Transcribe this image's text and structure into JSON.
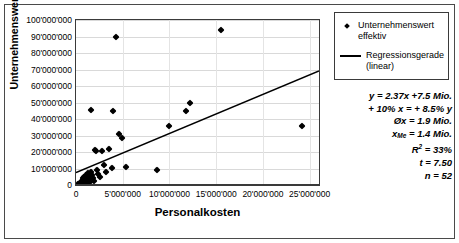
{
  "chart_data": {
    "type": "scatter",
    "title": "",
    "xlabel": "Personalkosten",
    "ylabel": "Unternehmenswert",
    "xlim": [
      0,
      26000000
    ],
    "ylim": [
      0,
      100000000
    ],
    "grid": true,
    "legend_position": "right",
    "x_ticks": [
      {
        "value": 0,
        "label": "0"
      },
      {
        "value": 5000000,
        "label": "5'000'000"
      },
      {
        "value": 10000000,
        "label": "10'000'000"
      },
      {
        "value": 15000000,
        "label": "15'000'000"
      },
      {
        "value": 20000000,
        "label": "20'000'000"
      },
      {
        "value": 25000000,
        "label": "25'000'000"
      }
    ],
    "y_ticks": [
      {
        "value": 0,
        "label": "0"
      },
      {
        "value": 10000000,
        "label": "10'000'000"
      },
      {
        "value": 20000000,
        "label": "20'000'000"
      },
      {
        "value": 30000000,
        "label": "30'000'000"
      },
      {
        "value": 40000000,
        "label": "40'000'000"
      },
      {
        "value": 50000000,
        "label": "50'000'000"
      },
      {
        "value": 60000000,
        "label": "60'000'000"
      },
      {
        "value": 70000000,
        "label": "70'000'000"
      },
      {
        "value": 80000000,
        "label": "80'000'000"
      },
      {
        "value": 90000000,
        "label": "90'000'000"
      },
      {
        "value": 100000000,
        "label": "100'000'000"
      }
    ],
    "series": [
      {
        "name": "Unternehmenswert effektiv",
        "type": "scatter",
        "marker": "diamond",
        "color": "#000000",
        "points": [
          [
            200000,
            500000
          ],
          [
            300000,
            900000
          ],
          [
            350000,
            300000
          ],
          [
            400000,
            1400000
          ],
          [
            450000,
            600000
          ],
          [
            500000,
            2000000
          ],
          [
            520000,
            1000000
          ],
          [
            560000,
            400000
          ],
          [
            600000,
            2600000
          ],
          [
            620000,
            1600000
          ],
          [
            650000,
            800000
          ],
          [
            700000,
            3200000
          ],
          [
            720000,
            2200000
          ],
          [
            760000,
            1200000
          ],
          [
            800000,
            4000000
          ],
          [
            820000,
            2800000
          ],
          [
            850000,
            1800000
          ],
          [
            880000,
            700000
          ],
          [
            900000,
            5000000
          ],
          [
            950000,
            3400000
          ],
          [
            1000000,
            2400000
          ],
          [
            1020000,
            1300000
          ],
          [
            1100000,
            6200000
          ],
          [
            1150000,
            4200000
          ],
          [
            1200000,
            2900000
          ],
          [
            1250000,
            1700000
          ],
          [
            1300000,
            7000000
          ],
          [
            1350000,
            5400000
          ],
          [
            1400000,
            3600000
          ],
          [
            1500000,
            2100000
          ],
          [
            1600000,
            8000000
          ],
          [
            1700000,
            6000000
          ],
          [
            1800000,
            4400000
          ],
          [
            1900000,
            2600000
          ],
          [
            2000000,
            21500000
          ],
          [
            2100000,
            20500000
          ],
          [
            2200000,
            9400000
          ],
          [
            2400000,
            6800000
          ],
          [
            2600000,
            4800000
          ],
          [
            2800000,
            20800000
          ],
          [
            3000000,
            12000000
          ],
          [
            3200000,
            7600000
          ],
          [
            3500000,
            22000000
          ],
          [
            3800000,
            10400000
          ],
          [
            4300000,
            89500000
          ],
          [
            4600000,
            31000000
          ],
          [
            4900000,
            28500000
          ],
          [
            5400000,
            11000000
          ],
          [
            8700000,
            8800000
          ],
          [
            9900000,
            36000000
          ],
          [
            11800000,
            45000000
          ],
          [
            15500000,
            94000000
          ],
          [
            24200000,
            35500000
          ],
          [
            1600000,
            45500000
          ],
          [
            4000000,
            44800000
          ],
          [
            12200000,
            50000000
          ]
        ]
      },
      {
        "name": "Regressionsgerade (linear)",
        "type": "line",
        "color": "#000000",
        "line": {
          "slope": 2.37,
          "intercept": 7500000
        },
        "endpoints": [
          [
            0,
            7500000
          ],
          [
            26000000,
            69120000
          ]
        ]
      }
    ],
    "legend": [
      {
        "label": "Unternehmenswert effektiv",
        "marker": "diamond"
      },
      {
        "label": "Regressionsgerade (linear)",
        "marker": "line"
      }
    ],
    "annotations": {
      "lines": [
        {
          "id": "equation",
          "text": "y = 2.37x +7.5 Mio."
        },
        {
          "id": "elasticity",
          "text": "+ 10% x = + 8.5% y"
        },
        {
          "id": "mean",
          "text": "Øx = 1.9 Mio."
        },
        {
          "id": "median",
          "prefix": "x",
          "sub": "Me",
          "text": " = 1.4 Mio."
        },
        {
          "id": "r-squared",
          "prefix": "R",
          "sup": "2",
          "text": " =  33%"
        },
        {
          "id": "t-value",
          "prefix": "t",
          "text": "   =  7.50"
        },
        {
          "id": "sample-size",
          "prefix": "n",
          "text": "  =  52"
        }
      ]
    }
  }
}
